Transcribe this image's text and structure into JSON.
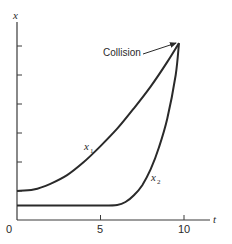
{
  "chart_data": {
    "type": "line",
    "title": "",
    "xlabel": "t",
    "ylabel": "x",
    "xlim": [
      0,
      11.5
    ],
    "ylim": [
      0,
      7
    ],
    "grid": false,
    "legend": "none (inline curve labels)",
    "x_ticks": [
      0,
      5,
      10
    ],
    "x_tick_labels": [
      "0",
      "5",
      "10"
    ],
    "y_ticks": [
      1,
      2,
      3,
      4,
      5,
      6
    ],
    "y_tick_labels": [],
    "series": [
      {
        "name": "x1",
        "label": "x",
        "subscript": "1",
        "x": [
          0,
          1,
          2,
          3,
          4,
          5,
          6,
          7,
          8,
          9,
          9.7
        ],
        "y": [
          1.0,
          1.05,
          1.25,
          1.55,
          2.0,
          2.55,
          3.15,
          3.85,
          4.6,
          5.45,
          6.1
        ]
      },
      {
        "name": "x2",
        "label": "x",
        "subscript": "2",
        "x": [
          0,
          1,
          2,
          3,
          4,
          5,
          6,
          6.5,
          7,
          7.5,
          8,
          8.5,
          9,
          9.5,
          9.7
        ],
        "y": [
          0.5,
          0.5,
          0.5,
          0.5,
          0.5,
          0.5,
          0.52,
          0.62,
          0.85,
          1.2,
          1.75,
          2.5,
          3.5,
          5.0,
          6.1
        ]
      }
    ],
    "annotations": [
      {
        "text": "Collision",
        "x": 9.7,
        "y": 6.1,
        "arrow": true
      }
    ],
    "colors": {
      "curve": "#2a2a2a",
      "axis": "#3a3a3a",
      "background": "#ffffff"
    }
  }
}
